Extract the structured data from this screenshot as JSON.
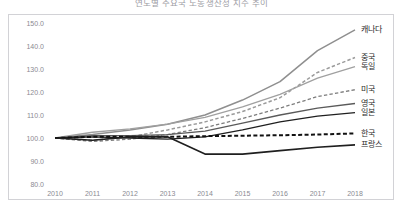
{
  "chart_data": {
    "type": "line",
    "title": "연도별 주요국 노동생산성 지수 추이",
    "xlabel": "",
    "ylabel": "",
    "x": [
      2010,
      2011,
      2012,
      2013,
      2014,
      2015,
      2016,
      2017,
      2018
    ],
    "xtick_labels": [
      "2010",
      "2011",
      "2012",
      "2013",
      "2014",
      "2015",
      "2016",
      "2017",
      "2018"
    ],
    "ytick_labels": [
      "150.0",
      "140.0",
      "130.0",
      "120.0",
      "110.0",
      "100.0",
      "90.0",
      "80.0"
    ],
    "ytick_values": [
      150.0,
      140.0,
      130.0,
      120.0,
      110.0,
      100.0,
      90.0,
      80.0
    ],
    "ylim": [
      80.0,
      150.0
    ],
    "grid": false,
    "legend_position": "right",
    "series": [
      {
        "name": "캐나다",
        "style": "solid",
        "color": "#8f8f8f",
        "width": 1.5,
        "values": [
          100.0,
          101.5,
          103.5,
          106.0,
          110.0,
          116.5,
          124.5,
          138.0,
          147.0
        ]
      },
      {
        "name": "중국",
        "style": "dashed",
        "color": "#9a9a9a",
        "width": 1.5,
        "values": [
          100.0,
          99.0,
          100.5,
          103.5,
          107.0,
          111.5,
          117.5,
          128.5,
          135.0
        ]
      },
      {
        "name": "독일",
        "style": "solid",
        "color": "#a0a0a0",
        "width": 1.3,
        "values": [
          100.0,
          102.5,
          104.0,
          106.0,
          109.0,
          113.5,
          119.0,
          126.0,
          131.0
        ]
      },
      {
        "name": "미국",
        "style": "dashed",
        "color": "#7d7d7d",
        "width": 1.3,
        "values": [
          100.0,
          98.5,
          99.5,
          101.5,
          104.5,
          108.5,
          113.0,
          118.0,
          121.0
        ]
      },
      {
        "name": "영국",
        "style": "solid",
        "color": "#5a5a5a",
        "width": 1.3,
        "values": [
          100.0,
          101.0,
          101.0,
          101.5,
          103.0,
          106.5,
          110.0,
          113.0,
          115.0
        ]
      },
      {
        "name": "일본",
        "style": "solid",
        "color": "#1f1f1f",
        "width": 1.3,
        "values": [
          100.0,
          100.5,
          100.0,
          99.5,
          100.5,
          103.5,
          107.0,
          109.5,
          111.0
        ]
      },
      {
        "name": "한국",
        "style": "dashed",
        "color": "#111111",
        "width": 2.0,
        "values": [
          100.0,
          100.5,
          100.5,
          100.5,
          100.8,
          101.0,
          101.2,
          101.5,
          102.0
        ]
      },
      {
        "name": "프랑스",
        "style": "solid",
        "color": "#1f1f1f",
        "width": 1.6,
        "values": [
          100.0,
          99.0,
          100.5,
          100.5,
          93.0,
          93.0,
          94.5,
          96.0,
          97.0
        ]
      }
    ]
  }
}
